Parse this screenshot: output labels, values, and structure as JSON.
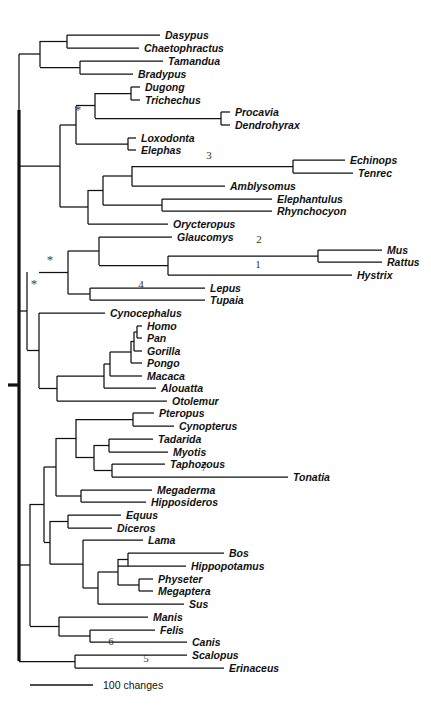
{
  "figure": {
    "kind": "phylogenetic-tree",
    "orientation": "left-to-right-rectangular-cladogram",
    "background_color": "#ffffff",
    "line_color": "#111111"
  },
  "scale": {
    "label": "100 changes",
    "bar_pixel_length": 63
  },
  "support_markers": [
    {
      "name": "asterisk-afrotheria",
      "symbol": "*",
      "x": 78,
      "y": 114
    },
    {
      "name": "asterisk-euarchontoglires",
      "symbol": "*",
      "x": 50,
      "y": 264
    },
    {
      "name": "asterisk-boreoeutheria",
      "symbol": "*",
      "x": 34,
      "y": 288
    }
  ],
  "node_numbers": [
    {
      "id": "3",
      "label": "3",
      "x": 209,
      "y": 159
    },
    {
      "id": "2",
      "label": "2",
      "x": 259,
      "y": 243
    },
    {
      "id": "1",
      "label": "1",
      "x": 258,
      "y": 268
    },
    {
      "id": "4",
      "label": "4",
      "x": 141,
      "y": 288
    },
    {
      "id": "7",
      "label": "7",
      "x": 204,
      "y": 471
    },
    {
      "id": "6",
      "label": "6",
      "x": 111,
      "y": 645
    },
    {
      "id": "5",
      "label": "5",
      "x": 146,
      "y": 662
    }
  ],
  "taxa": [
    {
      "name": "Dasypus",
      "y": 35,
      "tip_x": 160,
      "parent_x": 67
    },
    {
      "name": "Chaetophractus",
      "y": 48,
      "tip_x": 139,
      "parent_x": 67
    },
    {
      "name": "Tamandua",
      "y": 61,
      "tip_x": 163,
      "parent_x": 80
    },
    {
      "name": "Bradypus",
      "y": 74,
      "tip_x": 133,
      "parent_x": 80
    },
    {
      "name": "Dugong",
      "y": 87,
      "tip_x": 140,
      "parent_x": 131
    },
    {
      "name": "Trichechus",
      "y": 100,
      "tip_x": 140,
      "parent_x": 131
    },
    {
      "name": "Procavia",
      "y": 112,
      "tip_x": 230,
      "parent_x": 221
    },
    {
      "name": "Dendrohyrax",
      "y": 125,
      "tip_x": 230,
      "parent_x": 221
    },
    {
      "name": "Loxodonta",
      "y": 138,
      "tip_x": 136,
      "parent_x": 128
    },
    {
      "name": "Elephas",
      "y": 150,
      "tip_x": 136,
      "parent_x": 128
    },
    {
      "name": "Echinops",
      "y": 160,
      "tip_x": 345,
      "parent_x": 293
    },
    {
      "name": "Tenrec",
      "y": 173,
      "tip_x": 353,
      "parent_x": 293
    },
    {
      "name": "Amblysomus",
      "y": 186,
      "tip_x": 225,
      "parent_x": 132
    },
    {
      "name": "Elephantulus",
      "y": 199,
      "tip_x": 272,
      "parent_x": 162
    },
    {
      "name": "Rhynchocyon",
      "y": 211,
      "tip_x": 272,
      "parent_x": 162
    },
    {
      "name": "Orycteropus",
      "y": 224,
      "tip_x": 168,
      "parent_x": 88
    },
    {
      "name": "Glaucomys",
      "y": 237,
      "tip_x": 172,
      "parent_x": 99
    },
    {
      "name": "Mus",
      "y": 250,
      "tip_x": 382,
      "parent_x": 318
    },
    {
      "name": "Rattus",
      "y": 262,
      "tip_x": 382,
      "parent_x": 318
    },
    {
      "name": "Hystrix",
      "y": 275,
      "tip_x": 352,
      "parent_x": 168
    },
    {
      "name": "Lepus",
      "y": 288,
      "tip_x": 205,
      "parent_x": 90
    },
    {
      "name": "Tupaia",
      "y": 300,
      "tip_x": 205,
      "parent_x": 90
    },
    {
      "name": "Cynocephalus",
      "y": 313,
      "tip_x": 105,
      "parent_x": 39
    },
    {
      "name": "Homo",
      "y": 326,
      "tip_x": 142,
      "parent_x": 137
    },
    {
      "name": "Pan",
      "y": 338,
      "tip_x": 142,
      "parent_x": 137
    },
    {
      "name": "Gorilla",
      "y": 351,
      "tip_x": 142,
      "parent_x": 134
    },
    {
      "name": "Pongo",
      "y": 363,
      "tip_x": 142,
      "parent_x": 131
    },
    {
      "name": "Macaca",
      "y": 376,
      "tip_x": 142,
      "parent_x": 110
    },
    {
      "name": "Alouatta",
      "y": 388,
      "tip_x": 156,
      "parent_x": 104
    },
    {
      "name": "Otolemur",
      "y": 401,
      "tip_x": 167,
      "parent_x": 57
    },
    {
      "name": "Pteropus",
      "y": 413,
      "tip_x": 154,
      "parent_x": 133
    },
    {
      "name": "Cynopterus",
      "y": 426,
      "tip_x": 174,
      "parent_x": 133
    },
    {
      "name": "Tadarida",
      "y": 439,
      "tip_x": 153,
      "parent_x": 109
    },
    {
      "name": "Myotis",
      "y": 452,
      "tip_x": 168,
      "parent_x": 109
    },
    {
      "name": "Taphozous",
      "y": 464,
      "tip_x": 165,
      "parent_x": 112
    },
    {
      "name": "Tonatia",
      "y": 477,
      "tip_x": 288,
      "parent_x": 112
    },
    {
      "name": "Megaderma",
      "y": 490,
      "tip_x": 152,
      "parent_x": 81
    },
    {
      "name": "Hipposideros",
      "y": 502,
      "tip_x": 146,
      "parent_x": 81
    },
    {
      "name": "Equus",
      "y": 515,
      "tip_x": 121,
      "parent_x": 68
    },
    {
      "name": "Diceros",
      "y": 528,
      "tip_x": 112,
      "parent_x": 68
    },
    {
      "name": "Lama",
      "y": 540,
      "tip_x": 143,
      "parent_x": 83
    },
    {
      "name": "Bos",
      "y": 553,
      "tip_x": 224,
      "parent_x": 128
    },
    {
      "name": "Hippopotamus",
      "y": 566,
      "tip_x": 186,
      "parent_x": 118
    },
    {
      "name": "Physeter",
      "y": 579,
      "tip_x": 153,
      "parent_x": 139
    },
    {
      "name": "Megaptera",
      "y": 591,
      "tip_x": 153,
      "parent_x": 139
    },
    {
      "name": "Sus",
      "y": 604,
      "tip_x": 184,
      "parent_x": 98
    },
    {
      "name": "Manis",
      "y": 617,
      "tip_x": 148,
      "parent_x": 59
    },
    {
      "name": "Felis",
      "y": 630,
      "tip_x": 155,
      "parent_x": 90
    },
    {
      "name": "Canis",
      "y": 642,
      "tip_x": 187,
      "parent_x": 90
    },
    {
      "name": "Scalopus",
      "y": 655,
      "tip_x": 187,
      "parent_x": 75
    },
    {
      "name": "Erinaceus",
      "y": 668,
      "tip_x": 224,
      "parent_x": 75
    }
  ],
  "internal_nodes": [
    {
      "id": "armadillos",
      "x": 67,
      "y_top": 35,
      "y_bottom": 48,
      "parent_x": 40
    },
    {
      "id": "anteater-sloth",
      "x": 80,
      "y_top": 61,
      "y_bottom": 74,
      "parent_x": 40
    },
    {
      "id": "xenarthra",
      "x": 40,
      "y_top": 41,
      "y_bottom": 67,
      "parent_x": 19
    },
    {
      "id": "sirenia",
      "x": 131,
      "y_top": 87,
      "y_bottom": 100,
      "parent_x": 95
    },
    {
      "id": "hyracoidea",
      "x": 221,
      "y_top": 112,
      "y_bottom": 125,
      "parent_x": 95
    },
    {
      "id": "tethytheria",
      "x": 95,
      "y_top": 93,
      "y_bottom": 118,
      "parent_x": 76
    },
    {
      "id": "elephantidae",
      "x": 128,
      "y_top": 138,
      "y_bottom": 150,
      "parent_x": 76
    },
    {
      "id": "paenungulata",
      "x": 76,
      "y_top": 106,
      "y_bottom": 144,
      "parent_x": 60
    },
    {
      "id": "tenrecidae",
      "x": 293,
      "y_top": 160,
      "y_bottom": 173,
      "parent_x": 132
    },
    {
      "id": "afrosoricida",
      "x": 132,
      "y_top": 166,
      "y_bottom": 186,
      "parent_x": 103
    },
    {
      "id": "macroscelidea",
      "x": 162,
      "y_top": 199,
      "y_bottom": 211,
      "parent_x": 103
    },
    {
      "id": "afroinsectivora",
      "x": 103,
      "y_top": 176,
      "y_bottom": 205,
      "parent_x": 88
    },
    {
      "id": "afrotheria-core",
      "x": 88,
      "y_top": 190,
      "y_bottom": 224,
      "parent_x": 60
    },
    {
      "id": "afrotheria",
      "x": 60,
      "y_top": 125,
      "y_bottom": 207,
      "parent_x": 19
    },
    {
      "id": "atlantogenata",
      "x": 19,
      "y_top": 54,
      "y_bottom": 166,
      "parent_x": 19
    },
    {
      "id": "murinae",
      "x": 318,
      "y_top": 250,
      "y_bottom": 262,
      "parent_x": 168
    },
    {
      "id": "rodentia-core",
      "x": 168,
      "y_top": 256,
      "y_bottom": 275,
      "parent_x": 99
    },
    {
      "id": "glires-rodents",
      "x": 99,
      "y_top": 237,
      "y_bottom": 265,
      "parent_x": 68
    },
    {
      "id": "lagomorpha-scandentia",
      "x": 90,
      "y_top": 288,
      "y_bottom": 300,
      "parent_x": 68
    },
    {
      "id": "glires",
      "x": 68,
      "y_top": 251,
      "y_bottom": 294,
      "parent_x": 39
    },
    {
      "id": "hominini",
      "x": 137,
      "y_top": 326,
      "y_bottom": 338,
      "parent_x": 134
    },
    {
      "id": "homininae",
      "x": 134,
      "y_top": 332,
      "y_bottom": 351,
      "parent_x": 131
    },
    {
      "id": "hominidae",
      "x": 131,
      "y_top": 341,
      "y_bottom": 363,
      "parent_x": 110
    },
    {
      "id": "catarrhini",
      "x": 110,
      "y_top": 352,
      "y_bottom": 376,
      "parent_x": 104
    },
    {
      "id": "simiiformes",
      "x": 104,
      "y_top": 364,
      "y_bottom": 388,
      "parent_x": 57
    },
    {
      "id": "primates",
      "x": 57,
      "y_top": 376,
      "y_bottom": 401,
      "parent_x": 39
    },
    {
      "id": "primatomorpha",
      "x": 39,
      "y_top": 313,
      "y_bottom": 388,
      "parent_x": 27
    },
    {
      "id": "euarchontoglires",
      "x": 27,
      "y_top": 272,
      "y_bottom": 350,
      "parent_x": 19
    },
    {
      "id": "pteropodidae",
      "x": 133,
      "y_top": 413,
      "y_bottom": 426,
      "parent_x": 76
    },
    {
      "id": "vespertilionidae",
      "x": 109,
      "y_top": 439,
      "y_bottom": 452,
      "parent_x": 94
    },
    {
      "id": "emballonuridae",
      "x": 112,
      "y_top": 464,
      "y_bottom": 477,
      "parent_x": 94
    },
    {
      "id": "yangochiroptera",
      "x": 94,
      "y_top": 445,
      "y_bottom": 470,
      "parent_x": 76
    },
    {
      "id": "chiroptera-upper",
      "x": 76,
      "y_top": 419,
      "y_bottom": 458,
      "parent_x": 56
    },
    {
      "id": "rhinolophoidea",
      "x": 81,
      "y_top": 490,
      "y_bottom": 502,
      "parent_x": 56
    },
    {
      "id": "chiroptera",
      "x": 56,
      "y_top": 438,
      "y_bottom": 496,
      "parent_x": 44
    },
    {
      "id": "perissodactyla",
      "x": 68,
      "y_top": 515,
      "y_bottom": 528,
      "parent_x": 50
    },
    {
      "id": "bovid-hippo",
      "x": 128,
      "y_top": 553,
      "y_bottom": 566,
      "parent_x": 118
    },
    {
      "id": "cetacea",
      "x": 139,
      "y_top": 579,
      "y_bottom": 591,
      "parent_x": 118
    },
    {
      "id": "cetruminantia",
      "x": 118,
      "y_top": 559,
      "y_bottom": 585,
      "parent_x": 98
    },
    {
      "id": "artiodactyla-core",
      "x": 98,
      "y_top": 572,
      "y_bottom": 604,
      "parent_x": 83
    },
    {
      "id": "artiodactyla",
      "x": 83,
      "y_top": 540,
      "y_bottom": 588,
      "parent_x": 50
    },
    {
      "id": "ungulata",
      "x": 50,
      "y_top": 521,
      "y_bottom": 564,
      "parent_x": 44
    },
    {
      "id": "laurasia-upper",
      "x": 44,
      "y_top": 467,
      "y_bottom": 542,
      "parent_x": 30
    },
    {
      "id": "carnivora",
      "x": 90,
      "y_top": 630,
      "y_bottom": 642,
      "parent_x": 59
    },
    {
      "id": "ferae",
      "x": 59,
      "y_top": 617,
      "y_bottom": 636,
      "parent_x": 30
    },
    {
      "id": "laurasiatheria",
      "x": 30,
      "y_top": 504,
      "y_bottom": 626,
      "parent_x": 19
    },
    {
      "id": "eulipotyphla",
      "x": 75,
      "y_top": 655,
      "y_bottom": 668,
      "parent_x": 19
    }
  ],
  "root": {
    "x": 19,
    "y_top": 110,
    "y_bottom": 661,
    "stem_x_left": 19
  }
}
